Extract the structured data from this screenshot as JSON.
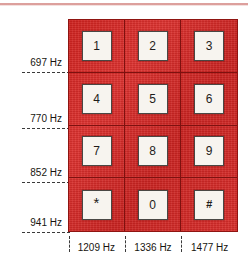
{
  "figure": {
    "type": "dtmf-keypad-frequency-diagram",
    "colors": {
      "keypad_red": "#d42a28",
      "keypad_grid_line": "#7e110f",
      "keycap_face": "#f7f4ef",
      "keycap_border": "#4a4744",
      "label_text": "#17150f",
      "leader_dash": "#3a3a3a",
      "page_rule": "#c9706c"
    },
    "row_frequencies": [
      {
        "label": "697 Hz",
        "value": 697,
        "unit": "Hz"
      },
      {
        "label": "770 Hz",
        "value": 770,
        "unit": "Hz"
      },
      {
        "label": "852 Hz",
        "value": 852,
        "unit": "Hz"
      },
      {
        "label": "941 Hz",
        "value": 941,
        "unit": "Hz"
      }
    ],
    "column_frequencies": [
      {
        "label": "1209 Hz",
        "value": 1209,
        "unit": "Hz"
      },
      {
        "label": "1336 Hz",
        "value": 1336,
        "unit": "Hz"
      },
      {
        "label": "1477 Hz",
        "value": 1477,
        "unit": "Hz"
      }
    ],
    "keys": [
      [
        {
          "label": "1"
        },
        {
          "label": "2"
        },
        {
          "label": "3"
        }
      ],
      [
        {
          "label": "4"
        },
        {
          "label": "5"
        },
        {
          "label": "6"
        }
      ],
      [
        {
          "label": "7"
        },
        {
          "label": "8"
        },
        {
          "label": "9"
        }
      ],
      [
        {
          "label": "*"
        },
        {
          "label": "0"
        },
        {
          "label": "#"
        }
      ]
    ]
  }
}
